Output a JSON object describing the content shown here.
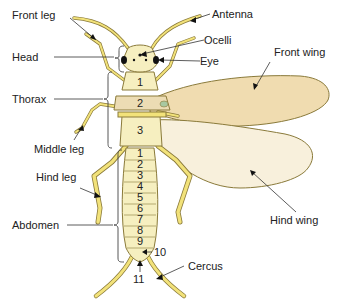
{
  "diagram": {
    "labels": {
      "front_leg": "Front leg",
      "head": "Head",
      "thorax": "Thorax",
      "middle_leg": "Middle leg",
      "hind_leg": "Hind leg",
      "abdomen": "Abdomen",
      "antenna": "Antenna",
      "ocelli": "Ocelli",
      "eye": "Eye",
      "front_wing": "Front wing",
      "hind_wing": "Hind wing",
      "cercus": "Cercus"
    },
    "thorax_segments": [
      "1",
      "2",
      "3"
    ],
    "abdomen_segments": [
      "1",
      "2",
      "3",
      "4",
      "5",
      "6",
      "7",
      "8",
      "9"
    ],
    "abdomen_end_labels": [
      "10",
      "11"
    ],
    "colors": {
      "body": "#f6efc0",
      "thorax_band": "#ecdcb4",
      "wing_front": "#f0dcb0",
      "wing_hind": "#f8f0dc",
      "leg": "#f2e27a",
      "outline": "#8a7a3a",
      "eye": "#111111",
      "spot": "#a8c8a0"
    }
  }
}
